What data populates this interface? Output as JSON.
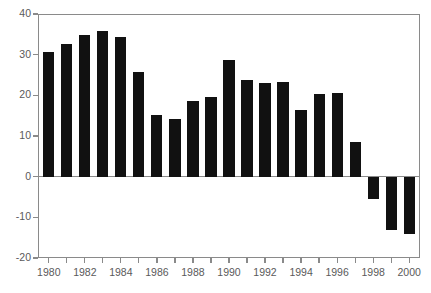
{
  "chart_data": {
    "type": "bar",
    "title": "",
    "subtitle": "",
    "xlabel": "",
    "ylabel": "",
    "categories": [
      "1980",
      "1981",
      "1982",
      "1983",
      "1984",
      "1985",
      "1986",
      "1987",
      "1988",
      "1989",
      "1990",
      "1991",
      "1992",
      "1993",
      "1994",
      "1995",
      "1996",
      "1997",
      "1998",
      "1999",
      "2000"
    ],
    "values": [
      30.7,
      32.7,
      34.8,
      35.7,
      34.3,
      25.7,
      15.2,
      14.2,
      18.5,
      19.6,
      28.6,
      23.7,
      23.0,
      23.4,
      16.3,
      20.3,
      20.6,
      8.5,
      -5.4,
      -13.2,
      -14.2
    ],
    "ylim": [
      -20,
      40
    ],
    "xlim": [
      1979.4,
      2000.6
    ],
    "ytick_values": [
      40,
      30,
      20,
      10,
      0,
      -10,
      -20
    ],
    "ytick_labels": [
      "40",
      "30",
      "20",
      "10",
      "0",
      "-10",
      "-20"
    ],
    "xtick_values": [
      1980,
      1981,
      1982,
      1983,
      1984,
      1985,
      1986,
      1987,
      1988,
      1989,
      1990,
      1991,
      1992,
      1993,
      1994,
      1995,
      1996,
      1997,
      1998,
      1999,
      2000
    ],
    "xtick_labels": [
      "1980",
      "",
      "1982",
      "",
      "1984",
      "",
      "1986",
      "",
      "1988",
      "",
      "1990",
      "",
      "1992",
      "",
      "1994",
      "",
      "1996",
      "",
      "1998",
      "",
      "2000"
    ],
    "grid": false,
    "legend": null,
    "bar_color": "#111111",
    "axis_color": "#8a8a8a",
    "tick_label_color": "#5a5a5a",
    "background_color": "#ffffff",
    "zero_line": 0,
    "annotations": []
  }
}
